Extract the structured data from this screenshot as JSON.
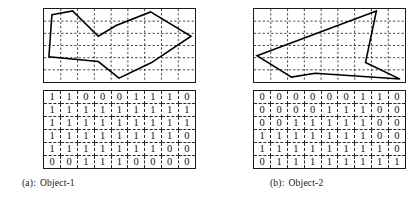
{
  "figure": {
    "panels": [
      {
        "id": "panel-a",
        "caption_tag": "(a):",
        "caption_text": "Object-1",
        "grid": {
          "cols": 9,
          "rows": 6
        },
        "polygon_points": "8,6 29,2 55,28 73,17 108,3 149,28 109,55 76,71 55,54 5,49",
        "matrix": [
          [
            "1",
            "1",
            "0",
            "0",
            "0",
            "1",
            "1",
            "1",
            "0"
          ],
          [
            "1",
            "1",
            "1",
            "1",
            "1",
            "1",
            "1",
            "1",
            "1"
          ],
          [
            "1",
            "1",
            "1",
            "1",
            "1",
            "1",
            "1",
            "1",
            "1"
          ],
          [
            "1",
            "1",
            "1",
            "1",
            "1",
            "1",
            "1",
            "1",
            "0"
          ],
          [
            "1",
            "1",
            "1",
            "1",
            "1",
            "1",
            "1",
            "0",
            "0"
          ],
          [
            "0",
            "0",
            "1",
            "1",
            "1",
            "0",
            "0",
            "0",
            "0"
          ]
        ]
      },
      {
        "id": "panel-b",
        "caption_tag": "(b):",
        "caption_text": "Object-2",
        "grid": {
          "cols": 9,
          "rows": 6
        },
        "polygon_points": "3,48 124,2 113,55 148,72 62,66 38,70 3,48",
        "matrix": [
          [
            "0",
            "0",
            "0",
            "0",
            "0",
            "0",
            "1",
            "1",
            "0"
          ],
          [
            "0",
            "0",
            "0",
            "0",
            "1",
            "1",
            "1",
            "0",
            "0"
          ],
          [
            "0",
            "0",
            "1",
            "1",
            "1",
            "1",
            "1",
            "0",
            "0"
          ],
          [
            "1",
            "1",
            "1",
            "1",
            "1",
            "1",
            "1",
            "0",
            "0"
          ],
          [
            "1",
            "1",
            "1",
            "1",
            "1",
            "1",
            "1",
            "1",
            "0"
          ],
          [
            "0",
            "1",
            "1",
            "1",
            "1",
            "1",
            "1",
            "1",
            "1"
          ]
        ]
      }
    ],
    "colors": {
      "ink": "#000000",
      "grid_dash": "#2b2b2b",
      "frame": "#1a1a1a",
      "background": "#ffffff"
    }
  }
}
